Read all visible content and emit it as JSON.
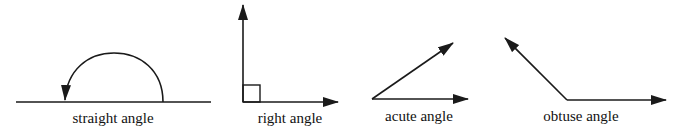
{
  "diagram": {
    "stroke_color": "#1a1a1a",
    "background": "#ffffff",
    "angles": [
      {
        "id": "straight",
        "label": "straight angle",
        "label_x": 113,
        "label_y": 111
      },
      {
        "id": "right",
        "label": "right angle",
        "label_x": 290,
        "label_y": 111
      },
      {
        "id": "acute",
        "label": "acute angle",
        "label_x": 419,
        "label_y": 109
      },
      {
        "id": "obtuse",
        "label": "obtuse angle",
        "label_x": 581,
        "label_y": 109
      }
    ]
  }
}
